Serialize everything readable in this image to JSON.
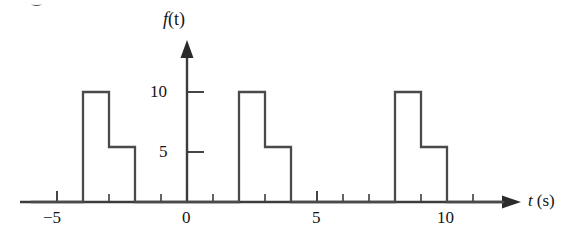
{
  "chart_data": {
    "type": "line",
    "title": "",
    "xlabel": "t (s)",
    "ylabel": "f(t)",
    "xlim": [
      -6.0,
      12.5
    ],
    "ylim": [
      0,
      12.5
    ],
    "grid": false,
    "legend": null,
    "x_ticks_major": [
      -5,
      0,
      5,
      10
    ],
    "x_tick_labels": [
      "−5",
      "0",
      "5",
      "10"
    ],
    "x_ticks_minor": [
      -4,
      -3,
      -2,
      -1,
      1,
      2,
      3,
      4,
      6,
      7,
      8,
      9
    ],
    "y_ticks": [
      5,
      10
    ],
    "y_tick_labels": [
      "5",
      "10"
    ],
    "waveform": {
      "description": "periodic staircase pulse train, period 6 s",
      "period": 6,
      "levels": [
        10,
        5,
        0
      ],
      "pulse_starts": [
        -4,
        2,
        8
      ],
      "segments": [
        {
          "t_start": -4,
          "t_end": -3,
          "value": 10
        },
        {
          "t_start": -3,
          "t_end": -2,
          "value": 5
        },
        {
          "t_start": -2,
          "t_end": 2,
          "value": 0
        },
        {
          "t_start": 2,
          "t_end": 3,
          "value": 10
        },
        {
          "t_start": 3,
          "t_end": 4,
          "value": 5
        },
        {
          "t_start": 4,
          "t_end": 8,
          "value": 0
        },
        {
          "t_start": 8,
          "t_end": 9,
          "value": 10
        },
        {
          "t_start": 9,
          "t_end": 10,
          "value": 5
        },
        {
          "t_start": 10,
          "t_end": 12.5,
          "value": 0
        }
      ],
      "points_x": [
        -6,
        -4,
        -4,
        -3,
        -3,
        -2,
        -2,
        2,
        2,
        3,
        3,
        4,
        4,
        8,
        8,
        9,
        9,
        10,
        10,
        12.2
      ],
      "points_y": [
        0,
        0,
        10,
        10,
        5,
        5,
        0,
        0,
        10,
        10,
        5,
        5,
        0,
        0,
        10,
        10,
        5,
        5,
        0,
        0
      ]
    },
    "colors": {
      "curve": "#3c3c3c",
      "axis": "#3c3c3c",
      "text": "#141414",
      "background": "#ffffff"
    }
  },
  "axes": {
    "y_axis_label": "f(t)",
    "y_axis_label_f": "f",
    "y_axis_label_paren": "(t)",
    "x_axis_label_t": "t",
    "x_axis_label_unit": "(s)",
    "y_label_10": "10",
    "y_label_5": "5",
    "x_label_neg5": "−5",
    "x_label_0": "0",
    "x_label_5": "5",
    "x_label_10": "10"
  }
}
